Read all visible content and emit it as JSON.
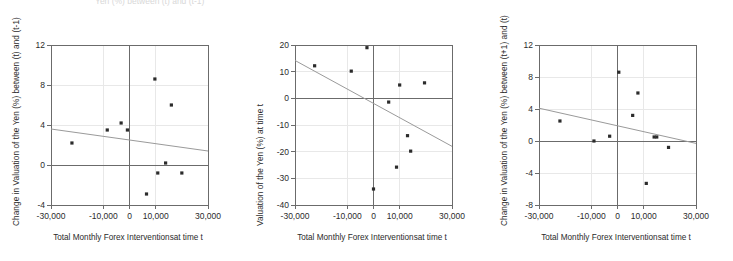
{
  "figure": {
    "background": "#ffffff",
    "axis_color": "#6b6b6b",
    "point_color": "#2b2b2b",
    "trend_color": "#9a9a9a",
    "grid_color": "#e8e8e8",
    "cut_off_title": "Yen (%) between (t) and (t-1)"
  },
  "charts": [
    {
      "id": "panel-1",
      "type": "scatter",
      "title": "",
      "xlabel": "Total Monthly Forex Interventionsat time t",
      "ylabel": "Change in Valuation of the Yen (%) between (t) and (t-1)",
      "xlim": [
        -30000,
        30000
      ],
      "ylim": [
        -4,
        12
      ],
      "xticks": [
        -30000,
        -10000,
        0,
        10000,
        30000
      ],
      "xticklabels": [
        "-30,000",
        "-10,000",
        "0",
        "10,000",
        "30,000"
      ],
      "yticks": [
        -4,
        0,
        4,
        8,
        12
      ],
      "yticklabels": [
        "-4",
        "0",
        "4",
        "8",
        "12"
      ],
      "grid": true,
      "legend": "none",
      "points": [
        {
          "x": -22000,
          "y": 2.2
        },
        {
          "x": -8500,
          "y": 3.5
        },
        {
          "x": -3200,
          "y": 4.2
        },
        {
          "x": -800,
          "y": 3.5
        },
        {
          "x": 6500,
          "y": -2.9
        },
        {
          "x": 9700,
          "y": 8.6
        },
        {
          "x": 10800,
          "y": -0.8
        },
        {
          "x": 13800,
          "y": 0.2
        },
        {
          "x": 16000,
          "y": 6.0
        },
        {
          "x": 20000,
          "y": -0.8
        }
      ],
      "trendline": {
        "x0": -30000,
        "y0": 3.6,
        "x1": 30000,
        "y1": 1.4
      }
    },
    {
      "id": "panel-2",
      "type": "scatter",
      "title": "",
      "xlabel": "Total Monthly Forex Interventionsat time t",
      "ylabel": "Valuation of the Yen (%) at time t",
      "xlim": [
        -30000,
        30000
      ],
      "ylim": [
        -40,
        20
      ],
      "xticks": [
        -30000,
        -10000,
        0,
        10000,
        30000
      ],
      "xticklabels": [
        "-30,000",
        "-10,000",
        "0",
        "10,000",
        "30,000"
      ],
      "yticks": [
        -40,
        -30,
        -20,
        -10,
        0,
        10,
        20
      ],
      "yticklabels": [
        "-40",
        "-30",
        "-20",
        "-10",
        "0",
        "10",
        "20"
      ],
      "grid": true,
      "legend": "none",
      "points": [
        {
          "x": -22500,
          "y": 12.2
        },
        {
          "x": -8500,
          "y": 10.2
        },
        {
          "x": -2500,
          "y": 19.0
        },
        {
          "x": 0,
          "y": -34.0
        },
        {
          "x": 5800,
          "y": -1.4
        },
        {
          "x": 8800,
          "y": -25.8
        },
        {
          "x": 10000,
          "y": 5.0
        },
        {
          "x": 13000,
          "y": -14.0
        },
        {
          "x": 14200,
          "y": -19.8
        },
        {
          "x": 19500,
          "y": 5.8
        }
      ],
      "trendline": {
        "x0": -30000,
        "y0": 14.2,
        "x1": 30000,
        "y1": -18.0
      }
    },
    {
      "id": "panel-3",
      "type": "scatter",
      "title": "",
      "xlabel": "Total Monthly Forex Interventionsat time t",
      "ylabel": "Change in Valuation of the Yen (%) between (t+1) and (t)",
      "xlim": [
        -30000,
        30000
      ],
      "ylim": [
        -8,
        12
      ],
      "xticks": [
        -30000,
        -10000,
        0,
        10000,
        30000
      ],
      "xticklabels": [
        "-30,000",
        "-10,000",
        "0",
        "10,000",
        "30,000"
      ],
      "yticks": [
        -8,
        -4,
        0,
        4,
        8,
        12
      ],
      "yticklabels": [
        "-8",
        "-4",
        "0",
        "4",
        "8",
        "12"
      ],
      "grid": true,
      "legend": "none",
      "points": [
        {
          "x": -22000,
          "y": 2.5
        },
        {
          "x": -9000,
          "y": 0.0
        },
        {
          "x": -3000,
          "y": 0.6
        },
        {
          "x": 500,
          "y": 8.6
        },
        {
          "x": 5800,
          "y": 3.2
        },
        {
          "x": 7800,
          "y": 6.0
        },
        {
          "x": 11000,
          "y": -5.3
        },
        {
          "x": 14000,
          "y": 0.5
        },
        {
          "x": 15000,
          "y": 0.5
        },
        {
          "x": 19500,
          "y": -0.8
        }
      ],
      "trendline": {
        "x0": -30000,
        "y0": 4.1,
        "x1": 30000,
        "y1": -0.3
      }
    }
  ]
}
